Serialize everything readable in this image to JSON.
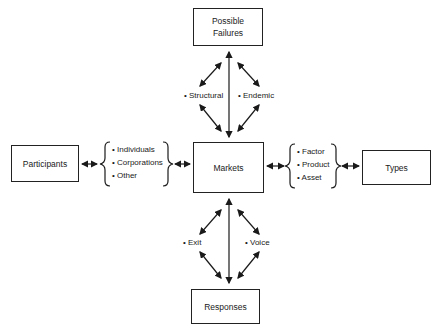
{
  "diagram": {
    "center": {
      "label": "Markets"
    },
    "top": {
      "label_line1": "Possible",
      "label_line2": "Failures",
      "links": [
        "• Structural",
        "• Endemic"
      ]
    },
    "left": {
      "label": "Participants",
      "items": [
        "• Individuals",
        "• Corporations",
        "• Other"
      ]
    },
    "right": {
      "label": "Types",
      "items": [
        "• Factor",
        "• Product",
        "• Asset"
      ]
    },
    "bottom": {
      "label": "Responses",
      "links": [
        "• Exit",
        "• Voice"
      ]
    }
  }
}
